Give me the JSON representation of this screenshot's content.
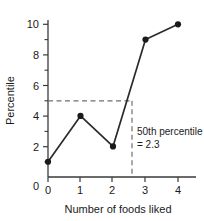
{
  "chart_data": {
    "type": "line",
    "title": "",
    "subtitle": "",
    "xlabel": "Number of foods liked",
    "ylabel": "Percentile",
    "x": [
      0,
      1,
      2,
      3,
      4
    ],
    "values": [
      1,
      4,
      2,
      9,
      10
    ],
    "series": [
      {
        "name": "Cumulative percentile",
        "x": [
          0,
          1,
          2,
          3,
          4
        ],
        "values": [
          1,
          4,
          2,
          9,
          10
        ]
      }
    ],
    "xlim": [
      0,
      4
    ],
    "ylim": [
      0,
      10
    ],
    "x_ticks": [
      "0",
      "1",
      "2",
      "3",
      "4"
    ],
    "y_ticks": [
      "0",
      "2",
      "4",
      "6",
      "8",
      "10"
    ],
    "y_minor_ticks": [
      1,
      3,
      5,
      7,
      9
    ],
    "grid": false,
    "legend": "none",
    "marker": "filled-circle",
    "line_color": "#2b2b2b",
    "marker_color": "#1a1a1a",
    "guide_color": "#808080",
    "annotations": [
      {
        "name": "median-guide",
        "line1": "50th percentile",
        "line2": "= 2.3",
        "h_line_y": 5,
        "v_line_x": 2.4
      }
    ]
  },
  "axes": {
    "y": {
      "title": "Percentile",
      "ticks": [
        {
          "label": "10",
          "value": 10
        },
        {
          "label": "8",
          "value": 8
        },
        {
          "label": "6",
          "value": 6
        },
        {
          "label": "4",
          "value": 4
        },
        {
          "label": "2",
          "value": 2
        },
        {
          "label": "0",
          "value": 0
        }
      ]
    },
    "x": {
      "title": "Number of foods liked",
      "ticks": [
        {
          "label": "0",
          "value": 0
        },
        {
          "label": "1",
          "value": 1
        },
        {
          "label": "2",
          "value": 2
        },
        {
          "label": "3",
          "value": 3
        },
        {
          "label": "4",
          "value": 4
        }
      ]
    }
  },
  "annotation": {
    "line1": "50th percentile",
    "line2": "= 2.3"
  }
}
